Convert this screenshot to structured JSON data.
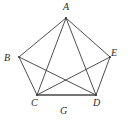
{
  "figure": {
    "caption": "G",
    "background_color": "#ffffff",
    "edge_color": "#3a3a3a",
    "base_edge_color": "#4a4a4a",
    "label_color": "#2b2b2b",
    "width": 128,
    "height": 125
  },
  "chart_data": {
    "type": "diagram",
    "title": "G",
    "vertices": [
      {
        "id": "A",
        "label": "A",
        "x": 66,
        "y": 18,
        "label_x": 63,
        "label_y": 2
      },
      {
        "id": "B",
        "label": "B",
        "x": 19,
        "y": 57,
        "label_x": 4,
        "label_y": 53
      },
      {
        "id": "C",
        "label": "C",
        "x": 37,
        "y": 95,
        "label_x": 31,
        "label_y": 98
      },
      {
        "id": "D",
        "label": "D",
        "x": 96,
        "y": 95,
        "label_x": 93,
        "label_y": 98
      },
      {
        "id": "E",
        "label": "E",
        "x": 110,
        "y": 57,
        "label_x": 111,
        "label_y": 48
      }
    ],
    "edges": [
      {
        "from": "A",
        "to": "B",
        "kind": "outer"
      },
      {
        "from": "A",
        "to": "E",
        "kind": "outer"
      },
      {
        "from": "B",
        "to": "C",
        "kind": "outer"
      },
      {
        "from": "D",
        "to": "E",
        "kind": "outer"
      },
      {
        "from": "C",
        "to": "D",
        "kind": "base"
      },
      {
        "from": "A",
        "to": "C",
        "kind": "chord"
      },
      {
        "from": "A",
        "to": "D",
        "kind": "chord"
      },
      {
        "from": "B",
        "to": "D",
        "kind": "chord"
      },
      {
        "from": "C",
        "to": "E",
        "kind": "chord"
      }
    ],
    "missing_edges": [
      {
        "from": "B",
        "to": "E"
      }
    ],
    "vertex_count": 5,
    "edge_count": 9
  }
}
